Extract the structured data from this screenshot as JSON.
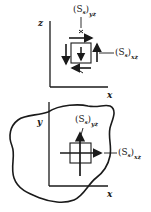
{
  "top_figure": {
    "axis_vertical": "z",
    "axis_horizontal": "x",
    "label_top": {
      "base": "(S",
      "inner_sub": "s",
      "close": ")",
      "outer_sub": "yz"
    },
    "label_right": {
      "base": "(S",
      "inner_sub": "s",
      "close": ")",
      "outer_sub": "xz"
    }
  },
  "bottom_figure": {
    "axis_vertical": "y",
    "axis_horizontal": "x",
    "label_top": {
      "base": "(S",
      "inner_sub": "s",
      "close": ")",
      "outer_sub": "yz"
    },
    "label_right": {
      "base": "(S",
      "inner_sub": "s",
      "close": ")",
      "outer_sub": "xz"
    }
  },
  "colors": {
    "ink": "#1a1a1a",
    "background": "#ffffff"
  }
}
